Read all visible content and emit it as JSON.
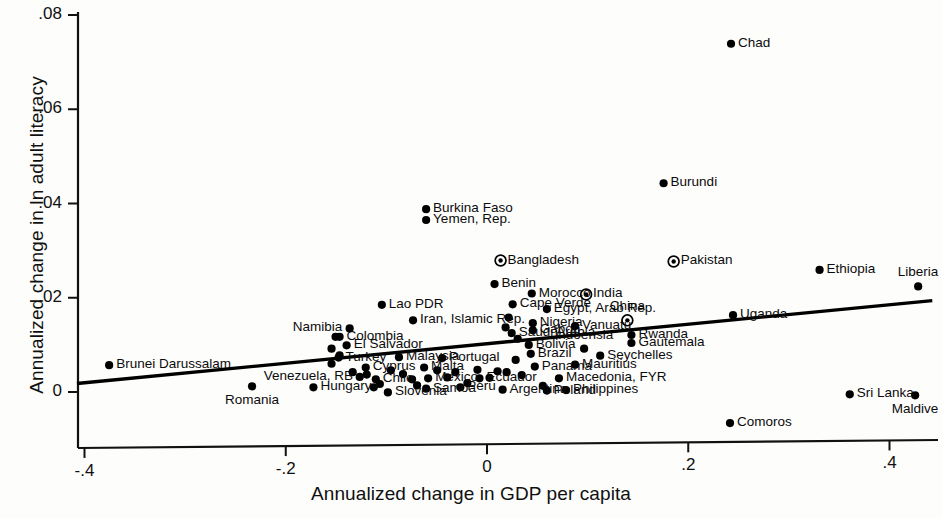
{
  "chart_data": {
    "type": "scatter",
    "title": "",
    "xlabel": "Annualized change in GDP per capita",
    "ylabel": "Annualized change in ln adult literacy",
    "xlim": [
      -0.44,
      0.452
    ],
    "ylim": [
      -0.0095,
      0.0815
    ],
    "xticks": [
      "-.4",
      "-.2",
      "0",
      ".2",
      ".4"
    ],
    "xtick_values": [
      -0.4,
      -0.2,
      0,
      0.2,
      0.4
    ],
    "yticks": [
      ".08",
      ".06",
      ".04",
      ".02",
      "0"
    ],
    "ytick_values": [
      0.08,
      0.06,
      0.04,
      0.02,
      0
    ],
    "grid": false,
    "legend": "none",
    "marker_color": "#000000",
    "line_color": "#000000",
    "fit_line": {
      "name": "linear fit",
      "x_start": -0.4075,
      "y_start": 0.0018,
      "x_end": 0.4425,
      "y_end": 0.0194
    },
    "points": [
      {
        "label": "Chad",
        "x": 0.2425,
        "y": 0.0739,
        "marker": "dot",
        "lpos": "right"
      },
      {
        "label": "Burundi",
        "x": 0.1755,
        "y": 0.0443,
        "marker": "dot",
        "lpos": "right"
      },
      {
        "label": "Burkina Faso",
        "x": -0.0605,
        "y": 0.0388,
        "marker": "dot",
        "lpos": "right"
      },
      {
        "label": "Yemen, Rep.",
        "x": -0.0605,
        "y": 0.0365,
        "marker": "dot",
        "lpos": "right"
      },
      {
        "label": "Bangladesh",
        "x": 0.0135,
        "y": 0.0279,
        "marker": "circle-dot",
        "lpos": "right"
      },
      {
        "label": "Pakistan",
        "x": 0.1855,
        "y": 0.0277,
        "marker": "circle-dot",
        "lpos": "right"
      },
      {
        "label": "Ethiopia",
        "x": 0.3305,
        "y": 0.0259,
        "marker": "dot",
        "lpos": "right"
      },
      {
        "label": "Benin",
        "x": 0.0075,
        "y": 0.0229,
        "marker": "dot",
        "lpos": "right"
      },
      {
        "label": "Liberia",
        "x": 0.4285,
        "y": 0.0224,
        "marker": "dot",
        "lpos": "above"
      },
      {
        "label": "Morocco",
        "x": 0.0445,
        "y": 0.0209,
        "marker": "dot",
        "lpos": "right"
      },
      {
        "label": "India",
        "x": 0.0985,
        "y": 0.0207,
        "marker": "circle-dot",
        "lpos": "right"
      },
      {
        "label": "Lao PDR",
        "x": -0.1045,
        "y": 0.0185,
        "marker": "dot",
        "lpos": "right"
      },
      {
        "label": "Cape Verde",
        "x": 0.0255,
        "y": 0.0186,
        "marker": "dot",
        "lpos": "right"
      },
      {
        "label": "Egypt, Arab Rep.",
        "x": 0.0595,
        "y": 0.0176,
        "marker": "dot",
        "lpos": "right"
      },
      {
        "label": "Uganda",
        "x": 0.2445,
        "y": 0.0163,
        "marker": "dot",
        "lpos": "right"
      },
      {
        "label": "China",
        "x": 0.1395,
        "y": 0.0152,
        "marker": "circle-dot",
        "lpos": "above"
      },
      {
        "label": "Iran, Islamic Rep.",
        "x": -0.0735,
        "y": 0.0152,
        "marker": "dot",
        "lpos": "right"
      },
      {
        "label": "Nigeria",
        "x": 0.0455,
        "y": 0.0146,
        "marker": "dot",
        "lpos": "right"
      },
      {
        "label": "Vanuatu",
        "x": 0.0875,
        "y": 0.014,
        "marker": "dot",
        "lpos": "right"
      },
      {
        "label": "Namibia",
        "x": -0.1365,
        "y": 0.0135,
        "marker": "dot",
        "lpos": "left"
      },
      {
        "label": "Gabon",
        "x": 0.0455,
        "y": 0.0131,
        "marker": "dot",
        "lpos": "right"
      },
      {
        "label": "Saudi Arabia",
        "x": 0.0245,
        "y": 0.0125,
        "marker": "dot",
        "lpos": "right"
      },
      {
        "label": "Colombia",
        "x": -0.1465,
        "y": 0.0117,
        "marker": "dot",
        "lpos": "right"
      },
      {
        "label": "Rwanda",
        "x": 0.1435,
        "y": 0.0121,
        "marker": "dot",
        "lpos": "right"
      },
      {
        "label": "Gautemala",
        "x": 0.1435,
        "y": 0.0104,
        "marker": "dot",
        "lpos": "right"
      },
      {
        "label": "Bolivia",
        "x": 0.0415,
        "y": 0.01,
        "marker": "dot",
        "lpos": "right"
      },
      {
        "label": "El Salvador",
        "x": -0.1395,
        "y": 0.0099,
        "marker": "dot",
        "lpos": "right"
      },
      {
        "label": "Indoensia",
        "x": 0.0965,
        "y": 0.0092,
        "marker": "dot",
        "lpos": "above"
      },
      {
        "label": "Brazil",
        "x": 0.0435,
        "y": 0.0081,
        "marker": "dot",
        "lpos": "right"
      },
      {
        "label": "Brunei Darussalam",
        "x": -0.3755,
        "y": 0.0057,
        "marker": "dot",
        "lpos": "right"
      },
      {
        "label": "Seychelles",
        "x": 0.1125,
        "y": 0.0077,
        "marker": "dot",
        "lpos": "right"
      },
      {
        "label": "Turkey",
        "x": -0.1475,
        "y": 0.0073,
        "marker": "dot",
        "lpos": "right"
      },
      {
        "label": "Malaysia",
        "x": -0.0875,
        "y": 0.0074,
        "marker": "dot",
        "lpos": "right"
      },
      {
        "label": "Portugal",
        "x": -0.0445,
        "y": 0.0072,
        "marker": "dot",
        "lpos": "right"
      },
      {
        "label": "Mauritius",
        "x": 0.0875,
        "y": 0.0058,
        "marker": "dot",
        "lpos": "right"
      },
      {
        "label": "Cyprus",
        "x": -0.1205,
        "y": 0.0052,
        "marker": "dot",
        "lpos": "right"
      },
      {
        "label": "Malta",
        "x": -0.0625,
        "y": 0.0052,
        "marker": "dot",
        "lpos": "right"
      },
      {
        "label": "Panama",
        "x": 0.0475,
        "y": 0.0054,
        "marker": "dot",
        "lpos": "right"
      },
      {
        "label": "Venezuela, RB",
        "x": -0.1265,
        "y": 0.0032,
        "marker": "dot",
        "lpos": "left"
      },
      {
        "label": "Chile",
        "x": -0.1105,
        "y": 0.0027,
        "marker": "dot",
        "lpos": "right"
      },
      {
        "label": "Mexico",
        "x": -0.0585,
        "y": 0.0029,
        "marker": "dot",
        "lpos": "right"
      },
      {
        "label": "Macedonia, FYR",
        "x": 0.0715,
        "y": 0.0029,
        "marker": "dot",
        "lpos": "right"
      },
      {
        "label": "Ecuador",
        "x": -0.0075,
        "y": 0.0029,
        "marker": "dot",
        "lpos": "right"
      },
      {
        "label": "Hungary",
        "x": -0.1725,
        "y": 0.001,
        "marker": "dot",
        "lpos": "right"
      },
      {
        "label": "Samoa",
        "x": -0.0605,
        "y": 0.0007,
        "marker": "dot",
        "lpos": "right"
      },
      {
        "label": "Peru",
        "x": -0.0265,
        "y": 0.001,
        "marker": "dot",
        "lpos": "right"
      },
      {
        "label": "Slovenia",
        "x": -0.0985,
        "y": -0.0001,
        "marker": "dot",
        "lpos": "right"
      },
      {
        "label": "Argentina",
        "x": 0.0155,
        "y": 0.0005,
        "marker": "dot",
        "lpos": "right"
      },
      {
        "label": "Poland",
        "x": 0.0595,
        "y": 0.0003,
        "marker": "dot",
        "lpos": "right"
      },
      {
        "label": "Philippines",
        "x": 0.0785,
        "y": 0.0004,
        "marker": "dot",
        "lpos": "right"
      },
      {
        "label": "Romania",
        "x": -0.2335,
        "y": 0.0012,
        "marker": "dot",
        "lpos": "below"
      },
      {
        "label": "Sri Lanka",
        "x": 0.3605,
        "y": -0.0005,
        "marker": "dot",
        "lpos": "right"
      },
      {
        "label": "Maldive",
        "x": 0.4255,
        "y": -0.0007,
        "marker": "dot",
        "lpos": "below"
      },
      {
        "label": "Comoros",
        "x": 0.2415,
        "y": -0.0066,
        "marker": "dot",
        "lpos": "right"
      }
    ],
    "extra_points": [
      {
        "x": -0.1505,
        "y": 0.0117
      },
      {
        "x": -0.1545,
        "y": 0.0092
      },
      {
        "x": -0.1465,
        "y": 0.0078
      },
      {
        "x": -0.1545,
        "y": 0.006
      },
      {
        "x": -0.1335,
        "y": 0.0042
      },
      {
        "x": -0.1195,
        "y": 0.0037
      },
      {
        "x": -0.1125,
        "y": 0.001
      },
      {
        "x": -0.1065,
        "y": 0.0017
      },
      {
        "x": -0.0955,
        "y": 0.0046
      },
      {
        "x": -0.0835,
        "y": 0.0038
      },
      {
        "x": -0.0745,
        "y": 0.0027
      },
      {
        "x": -0.0695,
        "y": 0.0014
      },
      {
        "x": -0.0495,
        "y": 0.0046
      },
      {
        "x": -0.0395,
        "y": 0.0031
      },
      {
        "x": -0.0315,
        "y": 0.0042
      },
      {
        "x": -0.0195,
        "y": 0.0019
      },
      {
        "x": -0.0095,
        "y": 0.0047
      },
      {
        "x": 0.0025,
        "y": 0.003
      },
      {
        "x": 0.0105,
        "y": 0.0044
      },
      {
        "x": 0.0195,
        "y": 0.0042
      },
      {
        "x": 0.0285,
        "y": 0.0068
      },
      {
        "x": 0.0345,
        "y": 0.0036
      },
      {
        "x": 0.0555,
        "y": 0.0013
      },
      {
        "x": 0.0305,
        "y": 0.0113
      },
      {
        "x": 0.0185,
        "y": 0.0137
      },
      {
        "x": 0.0215,
        "y": 0.0158
      }
    ]
  }
}
